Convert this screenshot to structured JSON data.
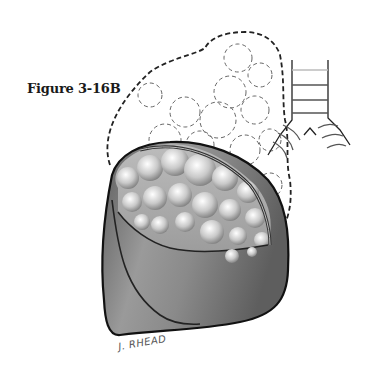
{
  "figure": {
    "caption": "Figure 3-16B",
    "signature": "J. RHEAD",
    "colors": {
      "outline": "#111111",
      "dashed_outline": "#222222",
      "lobe_fill_dark": "#6a6a6a",
      "lobe_fill_light": "#b5b5b5",
      "bulla_fill": "#dcdcdc",
      "trachea_stroke": "#555555"
    }
  }
}
